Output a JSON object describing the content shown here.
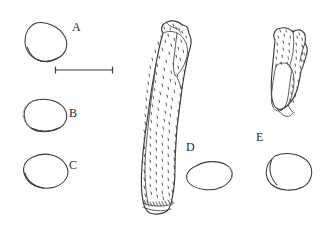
{
  "figure": {
    "kind": "scientific-line-drawing-plate",
    "background_color": "#ffffff",
    "ink_color": "#3a3a3a",
    "width": 324,
    "height": 227
  },
  "specimens": [
    {
      "id": "A",
      "label": "A",
      "label_x": 72,
      "label_y": 22,
      "type": "outline-cross-section",
      "description": "rounded sub-circular outline, upper left",
      "shape_cx": 45,
      "shape_cy": 42,
      "shape_rx": 22,
      "shape_ry": 19
    },
    {
      "id": "B",
      "label": "B",
      "label_x": 69,
      "label_y": 108,
      "type": "outline-cross-section",
      "description": "oval outline with broken (dashed) left margin",
      "shape_cx": 44,
      "shape_cy": 115,
      "shape_rx": 22,
      "shape_ry": 16
    },
    {
      "id": "C",
      "label": "C",
      "label_x": 69,
      "label_y": 160,
      "type": "outline-cross-section",
      "description": "tilted oval outline, lower left",
      "shape_cx": 45,
      "shape_cy": 170,
      "shape_rx": 22,
      "shape_ry": 17
    },
    {
      "id": "D",
      "label": "D",
      "label_x": 186,
      "label_y": 142,
      "type": "stippled-elongate-artifact",
      "description": "large elongate curved stippled specimen, centre of plate, with toothed basal edge and a separate oval cross-section outline below-right of the label",
      "shape_cx": 207,
      "shape_cy": 176,
      "shape_rx": 24,
      "shape_ry": 15
    },
    {
      "id": "E",
      "label": "E",
      "label_x": 256,
      "label_y": 132,
      "type": "stippled-artifact",
      "description": "smaller stippled specimen at upper right with pale inner facet, plus a rounded outline cross-section below",
      "shape_cx": 288,
      "shape_cy": 172,
      "shape_rx": 24,
      "shape_ry": 20
    }
  ],
  "scale_bar": {
    "name": "scale-bar",
    "x1": 55,
    "x2": 113,
    "y": 70,
    "tick_height": 7,
    "caption": ""
  }
}
